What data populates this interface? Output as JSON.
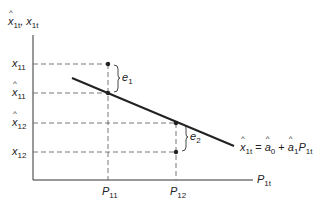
{
  "y_axis_label": {
    "main": "x̂",
    "sub": "1t",
    "sep": ", ",
    "main2": "x",
    "sub2": "1t"
  },
  "x_axis_label": {
    "main": "P",
    "sub": "1t"
  },
  "y_ticks": [
    {
      "main": "x",
      "sub": "11",
      "hat": false
    },
    {
      "main": "x",
      "sub": "11",
      "hat": true
    },
    {
      "main": "x",
      "sub": "12",
      "hat": true
    },
    {
      "main": "x",
      "sub": "12",
      "hat": false
    }
  ],
  "x_ticks": [
    {
      "main": "P",
      "sub": "11"
    },
    {
      "main": "P",
      "sub": "12"
    }
  ],
  "errors": [
    {
      "main": "e",
      "sub": "1"
    },
    {
      "main": "e",
      "sub": "2"
    }
  ],
  "equation": {
    "lhs": "x",
    "lhs_sub": "1t",
    "eq": " = ",
    "a0": "a",
    "a0_sub": "0",
    "plus": " + ",
    "a1": "a",
    "a1_sub": "1",
    "p": "P",
    "p_sub": "1t"
  },
  "colors": {
    "line": "#222222",
    "dash": "#555555"
  }
}
